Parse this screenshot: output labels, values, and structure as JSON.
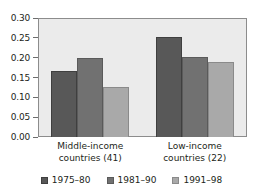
{
  "chart_data": {
    "type": "bar",
    "title": "",
    "subtitle": "",
    "xlabel": "",
    "ylabel": "",
    "ylim": [
      0.0,
      0.3
    ],
    "ytick_labels": [
      "0.30",
      "0.25",
      "0.20",
      "0.15",
      "0.10",
      "0.05",
      "0.00"
    ],
    "ytick_values": [
      0.3,
      0.25,
      0.2,
      0.15,
      0.1,
      0.05,
      0.0
    ],
    "grid": false,
    "legend_position": "bottom",
    "categories": [
      "Middle-income countries (41)",
      "Low-income countries (22)"
    ],
    "category_lines": [
      [
        "Middle-income",
        "countries (41)"
      ],
      [
        "Low-income",
        "countries (22)"
      ]
    ],
    "series": [
      {
        "name": "1975–80",
        "color": "#585858",
        "values": [
          0.167,
          0.251
        ]
      },
      {
        "name": "1981–90",
        "color": "#717171",
        "values": [
          0.2,
          0.202
        ]
      },
      {
        "name": "1991–98",
        "color": "#a9a9a9",
        "values": [
          0.127,
          0.189
        ]
      }
    ]
  },
  "colors": {
    "plot_background": "#ebebeb",
    "axis_line": "#8c8c8c",
    "tick_mark": "#6d6d6d",
    "text": "#231f20",
    "page_background": "#ffffff"
  }
}
